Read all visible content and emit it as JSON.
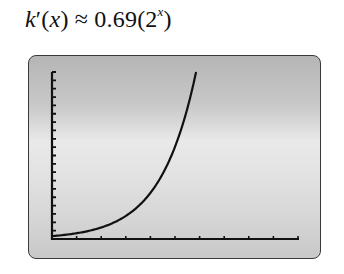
{
  "formula": {
    "func": "k",
    "prime": "′",
    "open": "(",
    "var": "x",
    "close": ")",
    "approx": " ≈ 0.69(2",
    "exp": "x",
    "end": ")"
  },
  "chart_data": {
    "type": "line",
    "xlabel": "",
    "ylabel": "",
    "xlim": [
      0,
      10
    ],
    "ylim": [
      0,
      40
    ],
    "x_tick_step": 1,
    "y_tick_step": 2,
    "x_ticks": [
      1,
      2,
      3,
      4,
      5,
      6,
      7,
      8,
      9,
      10
    ],
    "y_ticks": [
      2,
      4,
      6,
      8,
      10,
      12,
      14,
      16,
      18,
      20,
      22,
      24,
      26,
      28,
      30,
      32,
      34,
      36,
      38,
      40
    ],
    "grid": false,
    "legend": null,
    "series": [
      {
        "name": "k'(x) = 0.69(2^x)",
        "x": [
          0,
          0.5,
          1,
          1.5,
          2,
          2.5,
          3,
          3.5,
          4,
          4.5,
          5,
          5.5,
          5.85
        ],
        "y": [
          0.69,
          0.98,
          1.38,
          1.95,
          2.76,
          3.9,
          5.52,
          7.81,
          11.04,
          15.61,
          22.08,
          31.23,
          39.8
        ]
      }
    ]
  },
  "colors": {
    "curve": "#111111",
    "axes": "#111111",
    "frame_border": "#3a3a3a"
  }
}
